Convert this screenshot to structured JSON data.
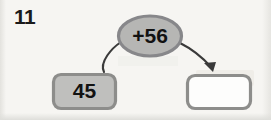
{
  "worksheet": {
    "problem_number": "11",
    "type": "arrow-diagram-function-machine"
  },
  "diagram": {
    "start_box": {
      "name": "start-value-box",
      "value": "45",
      "fill_color": "#bfbfbd",
      "border_color": "#8d8d8b"
    },
    "operator_oval": {
      "name": "operator-oval",
      "value": "+56",
      "fill_color": "#b6b6b4",
      "border_color": "#87878a"
    },
    "answer_box": {
      "name": "answer-box",
      "value": "",
      "placeholder": "",
      "fill_color": "#fdfdfc",
      "border_color": "#8d8d8b"
    },
    "connector_in": {
      "name": "connector-line-in",
      "has_arrowhead": false,
      "stroke_color": "#3a3a3a"
    },
    "connector_out": {
      "name": "connector-arrow-out",
      "has_arrowhead": true,
      "stroke_color": "#3a3a3a"
    }
  }
}
